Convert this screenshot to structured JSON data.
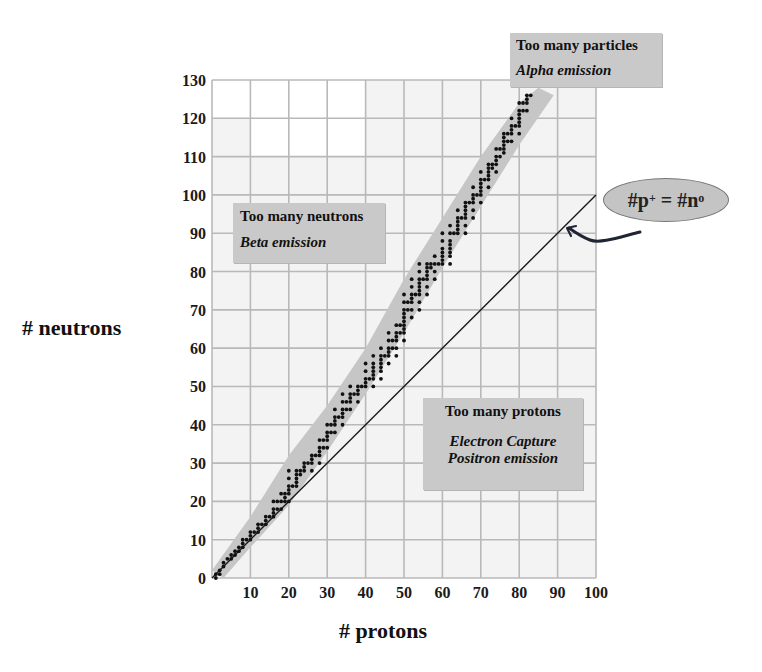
{
  "chart_data": {
    "type": "scatter",
    "title": "",
    "xlabel": "# protons",
    "ylabel": "# neutrons",
    "xlim": [
      0,
      100
    ],
    "ylim": [
      0,
      130
    ],
    "grid": true,
    "x_ticks": [
      10,
      20,
      30,
      40,
      50,
      60,
      70,
      80,
      90,
      100
    ],
    "y_ticks": [
      0,
      10,
      20,
      30,
      40,
      50,
      60,
      70,
      80,
      90,
      100,
      110,
      120,
      130
    ],
    "reference_line": {
      "label": "#p+ = #n0",
      "from": [
        0,
        0
      ],
      "to": [
        100,
        100
      ]
    },
    "band_of_stability": {
      "color": "#c8c8c8",
      "description": "gray band enclosing stable nuclei from (0,0) to about (84,126)"
    },
    "series": [
      {
        "name": "stable nuclei",
        "points": [
          [
            1,
            0
          ],
          [
            1,
            1
          ],
          [
            2,
            1
          ],
          [
            2,
            2
          ],
          [
            3,
            3
          ],
          [
            3,
            4
          ],
          [
            4,
            5
          ],
          [
            5,
            5
          ],
          [
            5,
            6
          ],
          [
            6,
            6
          ],
          [
            6,
            7
          ],
          [
            7,
            7
          ],
          [
            7,
            8
          ],
          [
            8,
            8
          ],
          [
            8,
            9
          ],
          [
            8,
            10
          ],
          [
            9,
            10
          ],
          [
            10,
            10
          ],
          [
            10,
            11
          ],
          [
            10,
            12
          ],
          [
            11,
            12
          ],
          [
            12,
            12
          ],
          [
            12,
            13
          ],
          [
            12,
            14
          ],
          [
            13,
            14
          ],
          [
            14,
            14
          ],
          [
            14,
            15
          ],
          [
            14,
            16
          ],
          [
            15,
            16
          ],
          [
            16,
            16
          ],
          [
            16,
            17
          ],
          [
            16,
            18
          ],
          [
            16,
            20
          ],
          [
            17,
            18
          ],
          [
            17,
            20
          ],
          [
            18,
            18
          ],
          [
            18,
            20
          ],
          [
            18,
            22
          ],
          [
            19,
            20
          ],
          [
            19,
            21
          ],
          [
            19,
            22
          ],
          [
            20,
            20
          ],
          [
            20,
            22
          ],
          [
            20,
            23
          ],
          [
            20,
            24
          ],
          [
            20,
            26
          ],
          [
            20,
            28
          ],
          [
            21,
            24
          ],
          [
            22,
            24
          ],
          [
            22,
            25
          ],
          [
            22,
            26
          ],
          [
            22,
            27
          ],
          [
            22,
            28
          ],
          [
            23,
            27
          ],
          [
            23,
            28
          ],
          [
            24,
            28
          ],
          [
            24,
            29
          ],
          [
            24,
            30
          ],
          [
            25,
            30
          ],
          [
            26,
            28
          ],
          [
            26,
            30
          ],
          [
            26,
            31
          ],
          [
            26,
            32
          ],
          [
            27,
            32
          ],
          [
            28,
            30
          ],
          [
            28,
            32
          ],
          [
            28,
            33
          ],
          [
            28,
            34
          ],
          [
            28,
            36
          ],
          [
            29,
            34
          ],
          [
            29,
            36
          ],
          [
            30,
            34
          ],
          [
            30,
            36
          ],
          [
            30,
            37
          ],
          [
            30,
            38
          ],
          [
            30,
            40
          ],
          [
            31,
            38
          ],
          [
            31,
            40
          ],
          [
            32,
            38
          ],
          [
            32,
            40
          ],
          [
            32,
            41
          ],
          [
            32,
            42
          ],
          [
            32,
            44
          ],
          [
            33,
            42
          ],
          [
            34,
            40
          ],
          [
            34,
            42
          ],
          [
            34,
            43
          ],
          [
            34,
            44
          ],
          [
            34,
            46
          ],
          [
            34,
            48
          ],
          [
            35,
            44
          ],
          [
            35,
            46
          ],
          [
            36,
            44
          ],
          [
            36,
            46
          ],
          [
            36,
            47
          ],
          [
            36,
            48
          ],
          [
            36,
            50
          ],
          [
            37,
            48
          ],
          [
            38,
            46
          ],
          [
            38,
            48
          ],
          [
            38,
            49
          ],
          [
            38,
            50
          ],
          [
            39,
            50
          ],
          [
            40,
            50
          ],
          [
            40,
            51
          ],
          [
            40,
            52
          ],
          [
            40,
            54
          ],
          [
            40,
            56
          ],
          [
            41,
            52
          ],
          [
            42,
            50
          ],
          [
            42,
            52
          ],
          [
            42,
            53
          ],
          [
            42,
            54
          ],
          [
            42,
            55
          ],
          [
            42,
            56
          ],
          [
            42,
            58
          ],
          [
            44,
            52
          ],
          [
            44,
            54
          ],
          [
            44,
            55
          ],
          [
            44,
            56
          ],
          [
            44,
            57
          ],
          [
            44,
            58
          ],
          [
            44,
            60
          ],
          [
            45,
            58
          ],
          [
            46,
            56
          ],
          [
            46,
            58
          ],
          [
            46,
            59
          ],
          [
            46,
            60
          ],
          [
            46,
            62
          ],
          [
            46,
            64
          ],
          [
            47,
            60
          ],
          [
            47,
            62
          ],
          [
            48,
            58
          ],
          [
            48,
            60
          ],
          [
            48,
            62
          ],
          [
            48,
            63
          ],
          [
            48,
            64
          ],
          [
            48,
            66
          ],
          [
            49,
            64
          ],
          [
            49,
            66
          ],
          [
            50,
            62
          ],
          [
            50,
            64
          ],
          [
            50,
            65
          ],
          [
            50,
            66
          ],
          [
            50,
            67
          ],
          [
            50,
            68
          ],
          [
            50,
            69
          ],
          [
            50,
            70
          ],
          [
            50,
            72
          ],
          [
            50,
            74
          ],
          [
            51,
            70
          ],
          [
            51,
            72
          ],
          [
            52,
            68
          ],
          [
            52,
            70
          ],
          [
            52,
            72
          ],
          [
            52,
            73
          ],
          [
            52,
            74
          ],
          [
            52,
            76
          ],
          [
            52,
            78
          ],
          [
            53,
            74
          ],
          [
            54,
            70
          ],
          [
            54,
            72
          ],
          [
            54,
            74
          ],
          [
            54,
            75
          ],
          [
            54,
            76
          ],
          [
            54,
            77
          ],
          [
            54,
            78
          ],
          [
            54,
            80
          ],
          [
            54,
            82
          ],
          [
            55,
            78
          ],
          [
            56,
            74
          ],
          [
            56,
            76
          ],
          [
            56,
            78
          ],
          [
            56,
            79
          ],
          [
            56,
            80
          ],
          [
            56,
            81
          ],
          [
            56,
            82
          ],
          [
            57,
            81
          ],
          [
            57,
            82
          ],
          [
            58,
            78
          ],
          [
            58,
            80
          ],
          [
            58,
            82
          ],
          [
            58,
            84
          ],
          [
            59,
            82
          ],
          [
            60,
            82
          ],
          [
            60,
            83
          ],
          [
            60,
            84
          ],
          [
            60,
            85
          ],
          [
            60,
            86
          ],
          [
            60,
            88
          ],
          [
            60,
            90
          ],
          [
            62,
            82
          ],
          [
            62,
            84
          ],
          [
            62,
            85
          ],
          [
            62,
            86
          ],
          [
            62,
            87
          ],
          [
            62,
            88
          ],
          [
            62,
            90
          ],
          [
            62,
            92
          ],
          [
            63,
            90
          ],
          [
            64,
            90
          ],
          [
            64,
            91
          ],
          [
            64,
            92
          ],
          [
            64,
            93
          ],
          [
            64,
            94
          ],
          [
            64,
            96
          ],
          [
            65,
            94
          ],
          [
            66,
            90
          ],
          [
            66,
            92
          ],
          [
            66,
            94
          ],
          [
            66,
            95
          ],
          [
            66,
            96
          ],
          [
            66,
            97
          ],
          [
            66,
            98
          ],
          [
            67,
            98
          ],
          [
            68,
            94
          ],
          [
            68,
            96
          ],
          [
            68,
            98
          ],
          [
            68,
            99
          ],
          [
            68,
            100
          ],
          [
            68,
            102
          ],
          [
            69,
            100
          ],
          [
            70,
            98
          ],
          [
            70,
            100
          ],
          [
            70,
            101
          ],
          [
            70,
            102
          ],
          [
            70,
            103
          ],
          [
            70,
            104
          ],
          [
            70,
            106
          ],
          [
            71,
            104
          ],
          [
            72,
            102
          ],
          [
            72,
            104
          ],
          [
            72,
            105
          ],
          [
            72,
            106
          ],
          [
            72,
            107
          ],
          [
            72,
            108
          ],
          [
            73,
            107
          ],
          [
            73,
            108
          ],
          [
            74,
            106
          ],
          [
            74,
            108
          ],
          [
            74,
            109
          ],
          [
            74,
            110
          ],
          [
            74,
            112
          ],
          [
            75,
            110
          ],
          [
            75,
            112
          ],
          [
            76,
            111
          ],
          [
            76,
            112
          ],
          [
            76,
            113
          ],
          [
            76,
            114
          ],
          [
            76,
            115
          ],
          [
            76,
            116
          ],
          [
            77,
            114
          ],
          [
            77,
            116
          ],
          [
            78,
            114
          ],
          [
            78,
            116
          ],
          [
            78,
            117
          ],
          [
            78,
            118
          ],
          [
            78,
            120
          ],
          [
            79,
            118
          ],
          [
            80,
            116
          ],
          [
            80,
            118
          ],
          [
            80,
            119
          ],
          [
            80,
            120
          ],
          [
            80,
            121
          ],
          [
            80,
            122
          ],
          [
            80,
            124
          ],
          [
            81,
            122
          ],
          [
            81,
            124
          ],
          [
            82,
            122
          ],
          [
            82,
            124
          ],
          [
            82,
            125
          ],
          [
            82,
            126
          ],
          [
            83,
            126
          ]
        ]
      }
    ],
    "annotations": [
      {
        "title": "Too many particles",
        "subtitle": "Alpha emission",
        "position": "top-right"
      },
      {
        "title": "Too many neutrons",
        "subtitle": "Beta emission",
        "position": "upper-left"
      },
      {
        "title": "Too many protons",
        "subtitle_lines": [
          "Electron Capture",
          "Positron emission"
        ],
        "position": "lower-right"
      },
      {
        "label": "#p+ = #n0",
        "points_to": "reference_line",
        "position": "right"
      }
    ]
  },
  "labels": {
    "xlabel": "# protons",
    "ylabel": "# neutrons",
    "alpha_title": "Too many particles",
    "alpha_sub": "Alpha emission",
    "beta_title": "Too many neutrons",
    "beta_sub": "Beta emission",
    "proton_title": "Too many protons",
    "proton_sub1": "Electron Capture",
    "proton_sub2": "Positron emission",
    "eq_p": "#p",
    "eq_p_sup": "+",
    "eq_mid": " = ",
    "eq_n": "#n",
    "eq_n_sup": "o"
  },
  "colors": {
    "plot_bg": "#f3f3f3",
    "grid": "#b9b9b9",
    "band": "#c6c6c6",
    "dots": "#111111",
    "line": "#1a1a1a",
    "arrow": "#1f2533"
  }
}
